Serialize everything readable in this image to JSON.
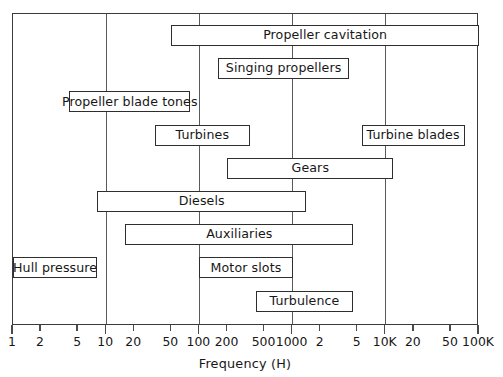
{
  "chart_data": {
    "type": "bar",
    "orientation": "horizontal-range",
    "title": "",
    "xlabel": "Frequency (H)",
    "ylabel": "",
    "xscale": "log",
    "xlim": [
      1,
      100000
    ],
    "grid": true,
    "legend": null,
    "gridlines_at": [
      10,
      100,
      1000,
      10000
    ],
    "axis_ticks": [
      {
        "label": "1",
        "value": 1,
        "major": true
      },
      {
        "label": "2",
        "value": 2,
        "major": false
      },
      {
        "label": "5",
        "value": 5,
        "major": false
      },
      {
        "label": "10",
        "value": 10,
        "major": true
      },
      {
        "label": "20",
        "value": 20,
        "major": false
      },
      {
        "label": "50",
        "value": 50,
        "major": false
      },
      {
        "label": "100",
        "value": 100,
        "major": true
      },
      {
        "label": "200",
        "value": 200,
        "major": false
      },
      {
        "label": "500",
        "value": 500,
        "major": false
      },
      {
        "label": "1000",
        "value": 1000,
        "major": true
      },
      {
        "label": "2",
        "value": 2000,
        "major": false
      },
      {
        "label": "5",
        "value": 5000,
        "major": false
      },
      {
        "label": "10K",
        "value": 10000,
        "major": true
      },
      {
        "label": "20",
        "value": 20000,
        "major": false
      },
      {
        "label": "50",
        "value": 50000,
        "major": false
      },
      {
        "label": "100K",
        "value": 100000,
        "major": true
      }
    ],
    "categories": [
      "Propeller cavitation",
      "Singing propellers",
      "Propeller blade tones",
      "Turbines",
      "Turbine blades",
      "Gears",
      "Diesels",
      "Auxiliaries",
      "Hull pressure",
      "Motor slots",
      "Turbulence"
    ],
    "bars": [
      {
        "label": "Propeller cavitation",
        "row": 0,
        "start_hz": 50,
        "end_hz": 100000
      },
      {
        "label": "Singing propellers",
        "row": 1,
        "start_hz": 160,
        "end_hz": 4000
      },
      {
        "label": "Propeller blade tones",
        "row": 2,
        "start_hz": 4,
        "end_hz": 80
      },
      {
        "label": "Turbines",
        "row": 3,
        "start_hz": 33,
        "end_hz": 350
      },
      {
        "label": "Turbine blades",
        "row": 3,
        "start_hz": 5500,
        "end_hz": 70000
      },
      {
        "label": "Gears",
        "row": 4,
        "start_hz": 200,
        "end_hz": 12000
      },
      {
        "label": "Diesels",
        "row": 5,
        "start_hz": 8,
        "end_hz": 1400
      },
      {
        "label": "Auxiliaries",
        "row": 6,
        "start_hz": 16,
        "end_hz": 4500
      },
      {
        "label": "Hull pressure",
        "row": 7,
        "start_hz": 1,
        "end_hz": 8
      },
      {
        "label": "Motor slots",
        "row": 7,
        "start_hz": 100,
        "end_hz": 1000
      },
      {
        "label": "Turbulence",
        "row": 8,
        "start_hz": 400,
        "end_hz": 4500
      }
    ]
  },
  "colors": {
    "frame": "#3b3b3b",
    "gridline": "#5a5a5a",
    "bar_border": "#2e2e2e",
    "bar_fill": "#ffffff",
    "text": "#171717",
    "background": "#ffffff"
  }
}
